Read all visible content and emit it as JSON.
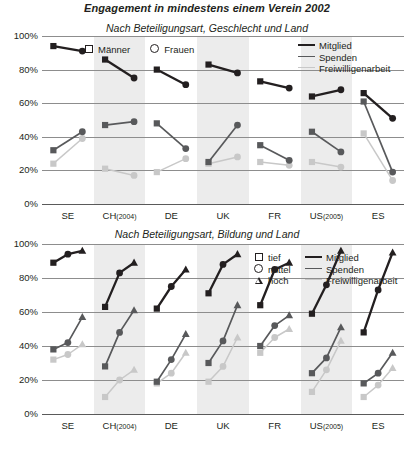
{
  "title": "Engagement in mindestens einem Verein 2002",
  "charts": [
    {
      "subtitle": "Nach Beteiligungsart, Geschlecht und Land",
      "legend_groups": [
        {
          "marker": "square-outline",
          "label": "Männer"
        },
        {
          "marker": "circle-outline",
          "label": "Frauen"
        }
      ],
      "legend_lines": [
        {
          "key": "mitglied",
          "label": "Mitglied",
          "color": "#231f20"
        },
        {
          "key": "spenden",
          "label": "Spenden",
          "color": "#58595b"
        },
        {
          "key": "freiwilligenarbeit",
          "label": "Freiwilligenarbeit",
          "color": "#c8c8c8"
        }
      ]
    },
    {
      "subtitle": "Nach Beteiligungsart, Bildung und Land",
      "legend_groups": [
        {
          "marker": "square-outline",
          "label": "tief"
        },
        {
          "marker": "circle-outline",
          "label": "mittel"
        },
        {
          "marker": "triangle-outline",
          "label": "hoch"
        }
      ],
      "legend_lines": [
        {
          "key": "mitglied",
          "label": "Mitglied",
          "color": "#231f20"
        },
        {
          "key": "spenden",
          "label": "Spenden",
          "color": "#58595b"
        },
        {
          "key": "freiwilligenarbeit",
          "label": "Freiwilligenarbeit",
          "color": "#c8c8c8"
        }
      ]
    }
  ],
  "axis": {
    "yticks": [
      "0%",
      "20%",
      "40%",
      "60%",
      "80%",
      "100%"
    ],
    "ymin": 0,
    "ymax": 100,
    "countries": [
      {
        "code": "SE",
        "year": ""
      },
      {
        "code": "CH",
        "year": "(2004)"
      },
      {
        "code": "DE",
        "year": ""
      },
      {
        "code": "UK",
        "year": ""
      },
      {
        "code": "FR",
        "year": ""
      },
      {
        "code": "US",
        "year": "(2005)"
      },
      {
        "code": "ES",
        "year": ""
      }
    ]
  },
  "chart_data": [
    {
      "type": "line",
      "title": "Engagement in mindestens einem Verein 2002",
      "subtitle": "Nach Beteiligungsart, Geschlecht und Land",
      "xlabel": "",
      "ylabel": "",
      "ylim": [
        0,
        100
      ],
      "grid": true,
      "legend_position": "top",
      "categories": [
        "SE",
        "CH (2004)",
        "DE",
        "UK",
        "FR",
        "US (2005)",
        "ES"
      ],
      "group_axis": "Geschlecht",
      "groups": [
        "Männer",
        "Frauen"
      ],
      "series": [
        {
          "name": "Mitglied",
          "color": "#231f20",
          "values": {
            "Männer": [
              94,
              86,
              80,
              83,
              73,
              64,
              66
            ],
            "Frauen": [
              91,
              75,
              71,
              78,
              69,
              68,
              51
            ]
          }
        },
        {
          "name": "Spenden",
          "color": "#58595b",
          "values": {
            "Männer": [
              32,
              47,
              48,
              25,
              35,
              43,
              61
            ],
            "Frauen": [
              43,
              49,
              33,
              47,
              26,
              31,
              19
            ]
          }
        },
        {
          "name": "Freiwilligenarbeit",
          "color": "#c8c8c8",
          "values": {
            "Männer": [
              24,
              21,
              19,
              24,
              25,
              25,
              42
            ],
            "Frauen": [
              39,
              17,
              27,
              28,
              23,
              22,
              14
            ]
          }
        }
      ]
    },
    {
      "type": "line",
      "title": "Engagement in mindestens einem Verein 2002",
      "subtitle": "Nach Beteiligungsart, Bildung und Land",
      "xlabel": "",
      "ylabel": "",
      "ylim": [
        0,
        100
      ],
      "grid": true,
      "legend_position": "top-right",
      "categories": [
        "SE",
        "CH (2004)",
        "DE",
        "UK",
        "FR",
        "US (2005)",
        "ES"
      ],
      "group_axis": "Bildung",
      "groups": [
        "tief",
        "mittel",
        "hoch"
      ],
      "series": [
        {
          "name": "Mitglied",
          "color": "#231f20",
          "values": {
            "tief": [
              89,
              63,
              62,
              71,
              64,
              59,
              48
            ],
            "mittel": [
              94,
              83,
              75,
              88,
              85,
              76,
              73
            ],
            "hoch": [
              96,
              89,
              85,
              94,
              89,
              96,
              95
            ]
          }
        },
        {
          "name": "Spenden",
          "color": "#58595b",
          "values": {
            "tief": [
              38,
              28,
              19,
              30,
              40,
              24,
              18
            ],
            "mittel": [
              42,
              48,
              32,
              43,
              52,
              33,
              24
            ],
            "hoch": [
              57,
              61,
              47,
              64,
              58,
              51,
              36
            ]
          }
        },
        {
          "name": "Freiwilligenarbeit",
          "color": "#c8c8c8",
          "values": {
            "tief": [
              32,
              10,
              18,
              19,
              36,
              13,
              10
            ],
            "mittel": [
              35,
              20,
              24,
              28,
              45,
              26,
              17
            ],
            "hoch": [
              41,
              26,
              36,
              45,
              50,
              43,
              27
            ]
          }
        }
      ]
    }
  ]
}
